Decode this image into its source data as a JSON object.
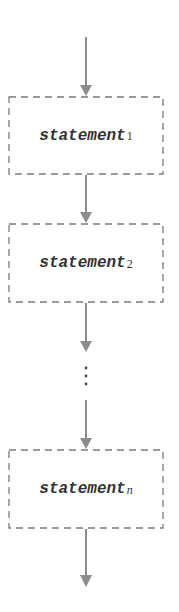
{
  "diagram": {
    "type": "sequential-flowchart",
    "colors": {
      "line": "#8c8c8c",
      "arrowhead": "#8c8c8c",
      "box_border": "#7a7a7a",
      "text": "#333333",
      "background": "#ffffff"
    },
    "statements": [
      {
        "name": "statement",
        "subscript": "1"
      },
      {
        "name": "statement",
        "subscript": "2"
      },
      {
        "name": "statement",
        "subscript": "n"
      }
    ],
    "ellipsis": "⋮"
  }
}
